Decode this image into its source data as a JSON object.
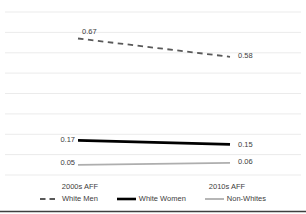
{
  "chart_data": {
    "type": "line",
    "categories": [
      "2000s AFF",
      "2010s AFF"
    ],
    "series": [
      {
        "name": "White Men",
        "values": [
          0.67,
          0.58
        ],
        "point_labels": [
          "0.67",
          "0.58"
        ],
        "color": "#595959",
        "line_style": "dashed",
        "width": 1.8,
        "dash": "5.5,4.5"
      },
      {
        "name": "White Women",
        "values": [
          0.17,
          0.15
        ],
        "point_labels": [
          "0.17",
          "0.15"
        ],
        "color": "#000000",
        "line_style": "solid",
        "width": 2.6,
        "dash": ""
      },
      {
        "name": "Non-Whites",
        "values": [
          0.05,
          0.06
        ],
        "point_labels": [
          "0.05",
          "0.06"
        ],
        "color": "#aeaeae",
        "line_style": "solid",
        "width": 1.8,
        "dash": ""
      }
    ],
    "ylim": [
      0,
      0.8
    ],
    "gridline_count": 9,
    "grid_on": true,
    "grid_color": "#ebebeb",
    "bottom_border_color": "#3f3f3f",
    "legend_position": "bottom"
  }
}
